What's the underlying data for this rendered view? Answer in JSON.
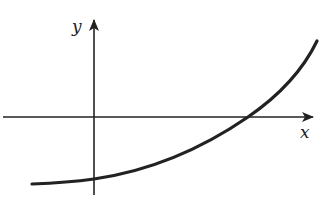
{
  "diagram": {
    "type": "function-graph",
    "axes": {
      "x_label": "x",
      "y_label": "y"
    },
    "curve": {
      "shape": "increasing, concave up",
      "y_intercept_sign": "negative",
      "x_intercept_sign": "positive",
      "left_behavior": "approaches a negative horizontal asymptote"
    },
    "colors": {
      "stroke": "#222222",
      "background": "#ffffff"
    }
  }
}
